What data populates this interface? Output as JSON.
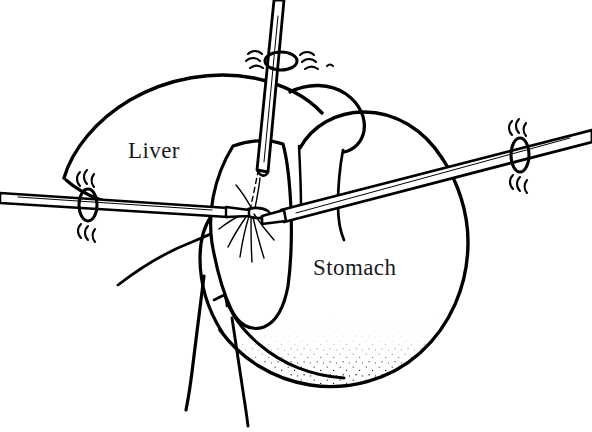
{
  "figure": {
    "background_color": "#ffffff",
    "ink_color": "#000000",
    "label_color": "#1a1a1a",
    "width": 592,
    "height": 432
  },
  "labels": {
    "liver": "Liver",
    "stomach": "Stomach"
  },
  "anatomy": [
    {
      "name": "liver",
      "label": "Liver",
      "label_x": 128,
      "label_y": 158,
      "description": "Left lobe of liver, upper left of field"
    },
    {
      "name": "stomach",
      "label": "Stomach",
      "label_x": 313,
      "label_y": 275,
      "description": "Stomach body and fundus, right and lower field"
    },
    {
      "name": "gastrohepatic-ligament",
      "label": "",
      "description": "Stippled lesser omentum tissue between liver and stomach"
    }
  ],
  "instruments": [
    {
      "name": "left-grasper",
      "tip_type": "open-jaw grasper",
      "entry": "left abdominal wall port",
      "orientation": "near-horizontal"
    },
    {
      "name": "top-retractor",
      "tip_type": "blunt retractor",
      "entry": "upper abdominal wall port",
      "orientation": "near-vertical"
    },
    {
      "name": "right-dissector",
      "tip_type": "dissector",
      "entry": "right abdominal wall port",
      "orientation": "angled from upper right"
    }
  ],
  "ports": [
    {
      "name": "left-port",
      "cx": 88,
      "cy": 205
    },
    {
      "name": "top-port",
      "cx": 281,
      "cy": 61
    },
    {
      "name": "right-port",
      "cx": 520,
      "cy": 155
    }
  ]
}
